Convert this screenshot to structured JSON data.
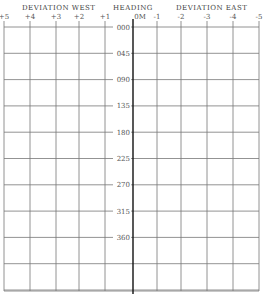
{
  "header": {
    "west_title": "DEVIATION WEST",
    "heading_title": "HEADING",
    "east_title": "DEVIATION EAST"
  },
  "chart_data": {
    "type": "line",
    "title": "",
    "xlabel_left": "DEVIATION WEST",
    "xlabel_center": "HEADING",
    "xlabel_right": "DEVIATION EAST",
    "x_ticks_west": [
      "+5",
      "+4",
      "+3",
      "+2",
      "+1"
    ],
    "x_ticks_east": [
      "0M",
      "-1",
      "-2",
      "-3",
      "-4",
      "-5"
    ],
    "y_ticks": [
      "000",
      "045",
      "090",
      "135",
      "180",
      "225",
      "270",
      "315",
      "360"
    ],
    "xlim": [
      5,
      -5
    ],
    "grid": true,
    "series": [
      {
        "name": "Deviation curve",
        "heading": [
          0,
          45,
          90,
          135,
          180,
          225,
          270,
          315,
          360
        ],
        "deviation": [
          -4,
          -5,
          -4,
          0,
          4,
          5,
          4,
          0,
          -4
        ]
      }
    ]
  }
}
